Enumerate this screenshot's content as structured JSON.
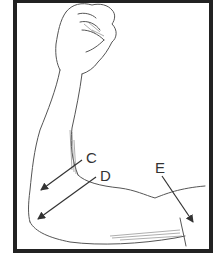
{
  "figure": {
    "colors": {
      "frame": "#222222",
      "line": "#444444",
      "background": "#ffffff"
    },
    "labels": [
      {
        "id": "C",
        "text": "C",
        "x": 86,
        "y": 151
      },
      {
        "id": "D",
        "text": "D",
        "x": 100,
        "y": 168
      },
      {
        "id": "E",
        "text": "E",
        "x": 155,
        "y": 160
      }
    ]
  }
}
